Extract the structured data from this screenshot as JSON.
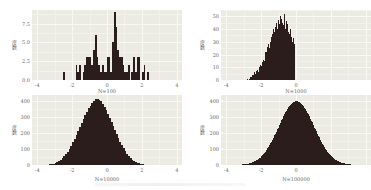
{
  "chart_data": [
    {
      "type": "bar",
      "title": "",
      "xlabel": "N=100",
      "ylabel": "度数",
      "xticks": [
        "-4",
        "-2",
        "0",
        "2",
        "4"
      ],
      "yticks": [
        "0.0",
        "2.5",
        "5.0",
        "7.5"
      ],
      "xlim": [
        -4.3,
        4.3
      ],
      "ylim": [
        0,
        9.3
      ],
      "grid": true,
      "bin_width": 0.1,
      "x": [
        -2.45,
        -1.75,
        -1.65,
        -1.55,
        -1.35,
        -1.25,
        -1.15,
        -1.05,
        -0.95,
        -0.85,
        -0.75,
        -0.65,
        -0.55,
        -0.45,
        -0.35,
        -0.25,
        -0.15,
        -0.05,
        0.05,
        0.15,
        0.25,
        0.35,
        0.45,
        0.55,
        0.65,
        0.75,
        0.85,
        0.95,
        1.05,
        1.15,
        1.25,
        1.45,
        1.55,
        1.65,
        1.75,
        1.85,
        2.05,
        2.15,
        2.35
      ],
      "values": [
        1,
        2,
        1,
        2,
        1,
        2,
        3,
        3,
        3,
        2,
        4,
        6,
        3,
        2,
        1,
        2,
        1,
        1,
        3,
        3,
        1,
        5,
        9,
        7,
        4,
        3,
        3,
        2,
        1,
        1,
        2,
        1,
        3,
        1,
        3,
        3,
        1,
        2,
        1
      ]
    },
    {
      "type": "bar",
      "title": "",
      "xlabel": "N=1000",
      "ylabel": "度数",
      "xticks": [
        "-4",
        "-2",
        "0"
      ],
      "yticks": [
        "0",
        "10",
        "20",
        "30",
        "40",
        "50"
      ],
      "xlim": [
        -4.3,
        4.3
      ],
      "ylim": [
        0,
        55
      ],
      "grid": true,
      "bin_width": 0.05,
      "x_start": -2.8,
      "values": [
        1,
        0,
        1,
        2,
        2,
        3,
        4,
        4,
        6,
        5,
        7,
        8,
        6,
        8,
        10,
        12,
        11,
        14,
        16,
        15,
        19,
        22,
        20,
        26,
        28,
        25,
        30,
        34,
        32,
        36,
        40,
        38,
        42,
        45,
        40,
        47,
        44,
        42,
        50,
        48,
        45,
        43,
        52,
        40,
        46,
        42,
        44,
        38,
        36,
        40,
        34,
        30,
        33,
        28,
        26
      ]
    },
    {
      "type": "bar",
      "title": "",
      "xlabel": "N=10000",
      "ylabel": "度数",
      "xticks": [
        "-4",
        "-2",
        "0",
        "2",
        "4"
      ],
      "yticks": [
        "0",
        "100",
        "200",
        "300",
        "400"
      ],
      "xlim": [
        -4.3,
        4.3
      ],
      "ylim": [
        0,
        440
      ],
      "grid": true,
      "bin_width": 0.1,
      "x_start": -3.6,
      "values": [
        1,
        2,
        3,
        4,
        6,
        9,
        12,
        17,
        24,
        32,
        42,
        55,
        68,
        84,
        102,
        121,
        143,
        165,
        190,
        214,
        240,
        265,
        290,
        314,
        335,
        356,
        374,
        390,
        402,
        412,
        416,
        410,
        400,
        385,
        366,
        346,
        322,
        298,
        272,
        246,
        220,
        194,
        170,
        146,
        124,
        104,
        86,
        70,
        56,
        44,
        34,
        26,
        19,
        14,
        10,
        7,
        5,
        3,
        2,
        1
      ]
    },
    {
      "type": "bar",
      "title": "",
      "xlabel": "N=100000",
      "ylabel": "度数",
      "xticks": [
        "-4",
        "-2",
        "0"
      ],
      "yticks": [
        "0",
        "100",
        "200",
        "300",
        "400"
      ],
      "xlim": [
        -4.3,
        4.3
      ],
      "ylim": [
        0,
        440
      ],
      "grid": true,
      "bin_width": 0.0333,
      "distribution": "normal(0,1)",
      "peak": 400
    }
  ],
  "panels": [
    {
      "xlabel": "N=100",
      "ylabel": "度数"
    },
    {
      "xlabel": "N=1000",
      "ylabel": "度数"
    },
    {
      "xlabel": "N=10000",
      "ylabel": "度数"
    },
    {
      "xlabel": "N=100000",
      "ylabel": "度数"
    }
  ]
}
